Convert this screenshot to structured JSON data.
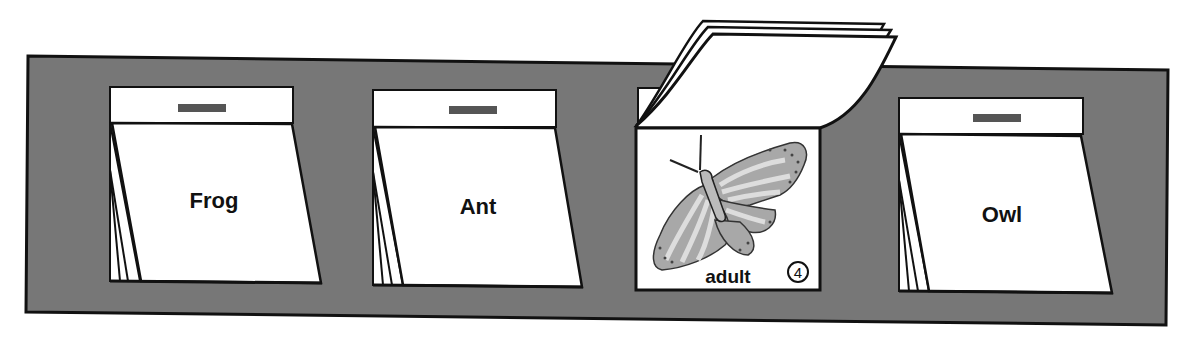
{
  "diagram": {
    "type": "flip-card life-cycle strip",
    "colors": {
      "panel": "#777777",
      "outline": "#111111",
      "card": "#ffffff",
      "tab": "#555555",
      "wing": "#a8a8a8",
      "wing_light": "#dddddd"
    },
    "cards": [
      {
        "label": "Frog",
        "state": "closed"
      },
      {
        "label": "Ant",
        "state": "closed"
      },
      {
        "label": "adult",
        "state": "flipped-open",
        "image": "butterfly-illustration",
        "page_number": "4"
      },
      {
        "label": "Owl",
        "state": "closed"
      }
    ]
  }
}
